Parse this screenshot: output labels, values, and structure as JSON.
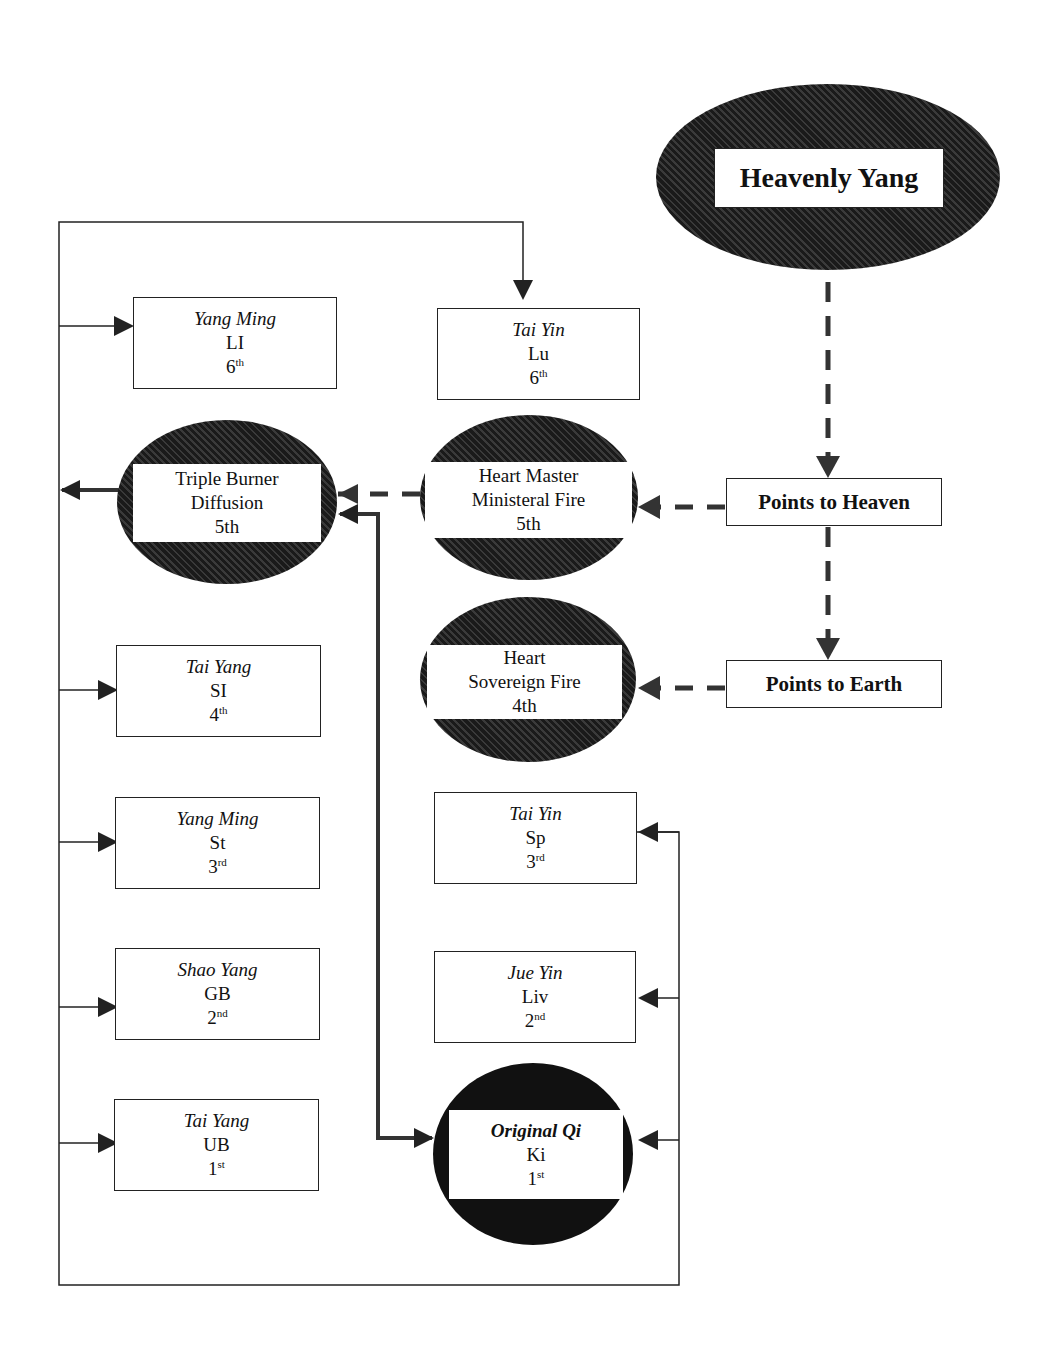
{
  "heavenly": {
    "label": "Heavenly Yang"
  },
  "points_heaven": {
    "label": "Points to Heaven"
  },
  "points_earth": {
    "label": "Points to Earth"
  },
  "yang": [
    {
      "channel": "Yang Ming",
      "organ": "LI",
      "num": "6",
      "sup": "th"
    },
    {
      "channel": "Tai Yang",
      "organ": "SI",
      "num": "4",
      "sup": "th"
    },
    {
      "channel": "Yang Ming",
      "organ": "St",
      "num": "3",
      "sup": "rd"
    },
    {
      "channel": "Shao Yang",
      "organ": "GB",
      "num": "2",
      "sup": "nd"
    },
    {
      "channel": "Tai Yang",
      "organ": "UB",
      "num": "1",
      "sup": "st"
    }
  ],
  "yin": [
    {
      "channel": "Tai Yin",
      "organ": "Lu",
      "num": "6",
      "sup": "th"
    },
    {
      "channel": "Tai Yin",
      "organ": "Sp",
      "num": "3",
      "sup": "rd"
    },
    {
      "channel": "Jue Yin",
      "organ": "Liv",
      "num": "2",
      "sup": "nd"
    }
  ],
  "triple_burner": {
    "line1": "Triple Burner",
    "line2": "Diffusion",
    "line3": "5th"
  },
  "heart_master": {
    "line1": "Heart Master",
    "line2": "Ministeral Fire",
    "line3": "5th"
  },
  "heart": {
    "line1": "Heart",
    "line2": "Sovereign Fire",
    "line3": "4th"
  },
  "original_qi": {
    "title": "Original Qi",
    "organ": "Ki",
    "num": "1",
    "sup": "st"
  }
}
